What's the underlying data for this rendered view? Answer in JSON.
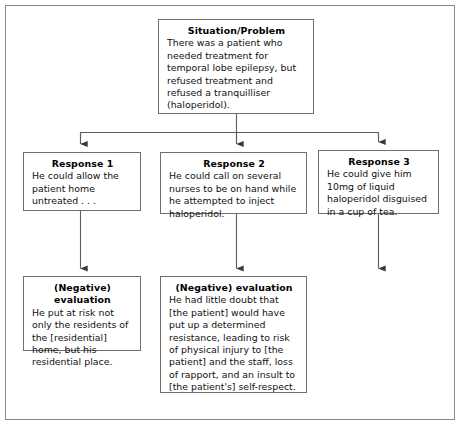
{
  "diagram": {
    "type": "flowchart",
    "frame": {
      "name": "outer-border"
    },
    "nodes": [
      {
        "id": "situation",
        "title": "Situation/Problem",
        "body": "There was a patient who needed treatment for temporal lobe epilepsy, but refused treatment and refused a tranquilliser (haloperidol)."
      },
      {
        "id": "response-1",
        "title": "Response 1",
        "body": "He could allow the patient home untreated . . ."
      },
      {
        "id": "response-2",
        "title": "Response 2",
        "body": "He could call on several nurses to be on hand while he attempted to inject haloperidol."
      },
      {
        "id": "response-3",
        "title": "Response 3",
        "body": "He could give him 10mg of liquid haloperidol disguised in a cup of tea."
      },
      {
        "id": "evaluation-1",
        "title": "(Negative) evaluation",
        "body": "He put at risk not only the residents of the [residential] home, but his residential place."
      },
      {
        "id": "evaluation-2",
        "title": "(Negative) evaluation",
        "body": "He had little doubt that [the patient] would have put up a determined resistance, leading to risk of physical injury to [the patient] and the staff, loss of rapport, and an insult to [the patient's] self-respect."
      }
    ],
    "connectors": [
      {
        "id": "situation-to-responses",
        "from": "situation",
        "to": [
          "response-1",
          "response-2",
          "response-3"
        ],
        "style": "split-arrow"
      },
      {
        "id": "response-1-to-evaluation-1",
        "from": "response-1",
        "to": "evaluation-1",
        "style": "arrow"
      },
      {
        "id": "response-2-to-evaluation-2",
        "from": "response-2",
        "to": "evaluation-2",
        "style": "arrow"
      },
      {
        "id": "response-3-to-open",
        "from": "response-3",
        "to": null,
        "style": "arrow"
      }
    ],
    "colors": {
      "box_border": "#6f6f6f",
      "frame_border": "#8a8a8a",
      "connector": "#5d5d5d",
      "text": "#111111",
      "background": "#ffffff"
    }
  }
}
